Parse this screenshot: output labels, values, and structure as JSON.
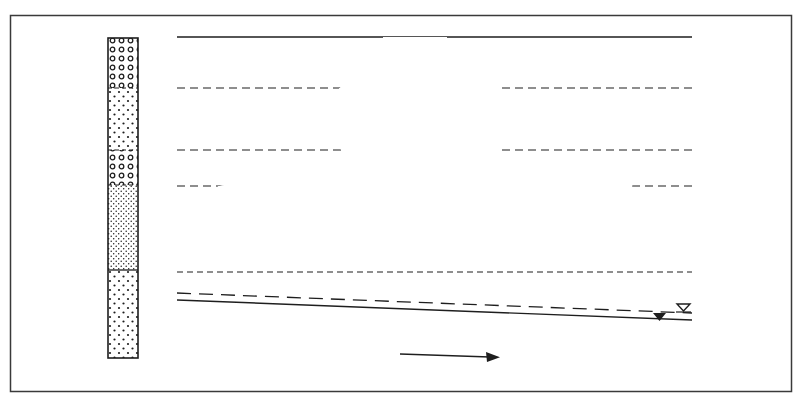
{
  "figure": {
    "frame": {
      "x": 10,
      "y": 15,
      "width": 781,
      "height": 376,
      "stroke": "#3a3a3a"
    },
    "colors": {
      "ink": "#1e1e1e",
      "background": "#ffffff",
      "frame": "#3a3a3a"
    }
  },
  "stratigraphic_column": {
    "x": 108,
    "width": 30,
    "top": 38,
    "bottom": 358,
    "layers": [
      {
        "name": "coarse-gravel-upper",
        "top": 38,
        "bottom": 88,
        "pattern": "circles"
      },
      {
        "name": "medium-sand-upper",
        "top": 88,
        "bottom": 150,
        "pattern": "dots-medium"
      },
      {
        "name": "coarse-gravel-lower",
        "top": 150,
        "bottom": 185,
        "pattern": "circles"
      },
      {
        "name": "fine-sand",
        "top": 185,
        "bottom": 270,
        "pattern": "dots-fine"
      },
      {
        "name": "medium-sand-lower",
        "top": 270,
        "bottom": 358,
        "pattern": "dots-medium"
      }
    ]
  },
  "horizon_lines": [
    {
      "name": "ground-surface",
      "y": 37,
      "x1": 177,
      "x2": 692,
      "style": "solid"
    },
    {
      "name": "layer-boundary-1",
      "y": 88,
      "x1": 177,
      "x2": 692,
      "style": "dashed"
    },
    {
      "name": "layer-boundary-2",
      "y": 150,
      "x1": 177,
      "x2": 692,
      "style": "dashed"
    },
    {
      "name": "layer-boundary-3",
      "y": 186,
      "x1": 177,
      "x2": 692,
      "style": "dashed"
    },
    {
      "name": "layer-boundary-4",
      "y": 272,
      "x1": 177,
      "x2": 692,
      "style": "dashed"
    }
  ],
  "water_table": {
    "capillary_fringe": {
      "x1": 177,
      "y1": 293,
      "x2": 692,
      "y2": 313,
      "style": "dashed",
      "symbol": "open-triangle",
      "symbol_x": 683,
      "symbol_y": 306
    },
    "phreatic_surface": {
      "x1": 177,
      "y1": 300,
      "x2": 692,
      "y2": 320,
      "style": "solid",
      "symbol": "filled-triangle",
      "symbol_x": 660,
      "symbol_y": 314
    }
  },
  "flow_arrow": {
    "x1": 400,
    "y1": 354,
    "x2": 500,
    "y2": 357,
    "meaning": "groundwater-flow-direction"
  },
  "plume": {
    "stem_pattern": "dots-medium",
    "core_pattern": "dots-medium",
    "spread_pattern": "dots-fine"
  }
}
